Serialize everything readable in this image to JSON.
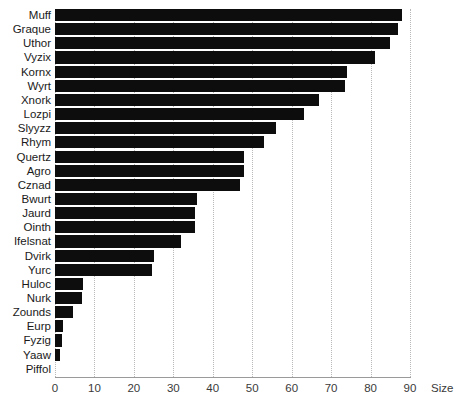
{
  "chart_data": {
    "type": "bar",
    "orientation": "horizontal",
    "title": "",
    "xlabel": "Size",
    "ylabel": "",
    "xlim": [
      0,
      90
    ],
    "xticks": [
      0,
      10,
      20,
      30,
      40,
      50,
      60,
      70,
      80,
      90
    ],
    "grid": "vertical-dotted",
    "legend": "none",
    "bar_color": "#0d0d0d",
    "categories": [
      "Muff",
      "Graque",
      "Uthor",
      "Vyzix",
      "Kornx",
      "Wyrt",
      "Xnork",
      "Lozpi",
      "Slyyzz",
      "Rhym",
      "Quertz",
      "Agro",
      "Cznad",
      "Bwurt",
      "Jaurd",
      "Ointh",
      "Ifelsnat",
      "Dvirk",
      "Yurc",
      "Huloc",
      "Nurk",
      "Zounds",
      "Eurp",
      "Fyzig",
      "Yaaw",
      "Piffol"
    ],
    "values": [
      88,
      87,
      85,
      81,
      74,
      73.5,
      67,
      63,
      56,
      53,
      48,
      48,
      47,
      36,
      35.5,
      35.5,
      32,
      25,
      24.5,
      7,
      6.8,
      4.5,
      2,
      1.8,
      1.2,
      0
    ]
  }
}
